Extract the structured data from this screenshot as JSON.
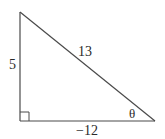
{
  "diagram": {
    "type": "right-triangle",
    "stroke_color": "#4a4a4a",
    "text_color": "#2a2a2a",
    "vertices": {
      "top": {
        "x": 20,
        "y": 12
      },
      "right_angle": {
        "x": 20,
        "y": 121
      },
      "theta_vertex": {
        "x": 155,
        "y": 121
      }
    },
    "labels": {
      "vertical_leg": "5",
      "hypotenuse": "13",
      "horizontal_leg": "−12",
      "angle": "θ"
    },
    "right_angle_marker_size": 9
  }
}
